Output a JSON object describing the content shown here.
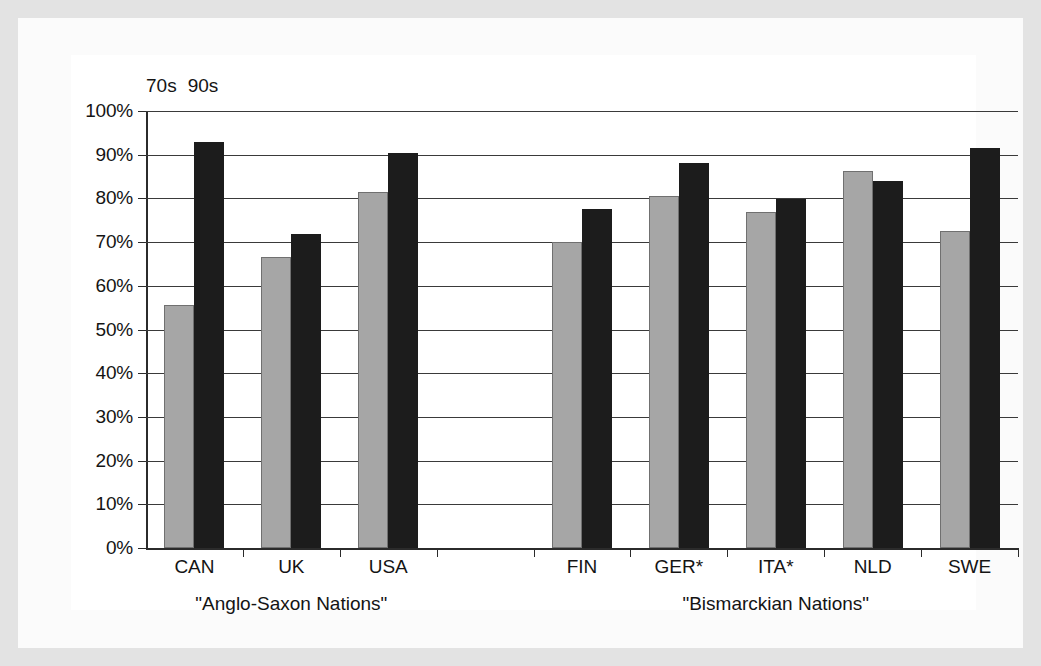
{
  "legend": {
    "entries": [
      {
        "label": "70s",
        "color": "#a6a6a6"
      },
      {
        "label": "90s",
        "color": "#1c1c1c"
      }
    ]
  },
  "axis": {
    "y_ticks": [
      "100%",
      "90%",
      "80%",
      "70%",
      "60%",
      "50%",
      "40%",
      "30%",
      "20%",
      "10%",
      "0%"
    ]
  },
  "groups": [
    {
      "label": "\"Anglo-Saxon Nations\""
    },
    {
      "label": "\"Bismarckian Nations\""
    }
  ],
  "chart_data": {
    "type": "bar",
    "title": "",
    "xlabel": "",
    "ylabel": "",
    "ylim": [
      0,
      100
    ],
    "grid": true,
    "legend_position": "top-left",
    "categories": [
      "CAN",
      "UK",
      "USA",
      "",
      "FIN",
      "GER*",
      "ITA*",
      "NLD",
      "SWE"
    ],
    "group_membership": [
      {
        "name": "\"Anglo-Saxon Nations\"",
        "categories": [
          "CAN",
          "UK",
          "USA"
        ]
      },
      {
        "name": "\"Bismarckian Nations\"",
        "categories": [
          "FIN",
          "GER*",
          "ITA*",
          "NLD",
          "SWE"
        ]
      }
    ],
    "series": [
      {
        "name": "70s",
        "color": "#a6a6a6",
        "values": [
          55.5,
          66.5,
          81.5,
          null,
          70.0,
          80.5,
          77.0,
          86.3,
          72.5
        ]
      },
      {
        "name": "90s",
        "color": "#1c1c1c",
        "values": [
          93.0,
          71.8,
          90.3,
          null,
          77.5,
          88.0,
          79.8,
          84.0,
          91.5
        ]
      }
    ]
  }
}
